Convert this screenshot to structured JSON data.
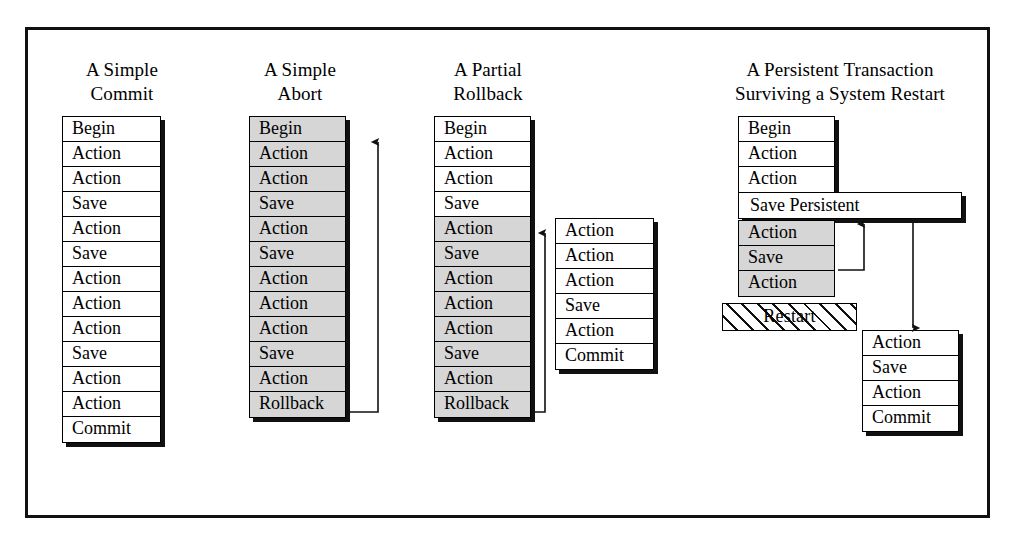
{
  "figure": {
    "title_hidden": "",
    "columns": [
      {
        "id": "simple-commit",
        "title_line1": "A Simple",
        "title_line2": "Commit",
        "rows": [
          {
            "label": "Begin",
            "shaded": false
          },
          {
            "label": "Action",
            "shaded": false
          },
          {
            "label": "Action",
            "shaded": false
          },
          {
            "label": "Save",
            "shaded": false
          },
          {
            "label": "Action",
            "shaded": false
          },
          {
            "label": "Save",
            "shaded": false
          },
          {
            "label": "Action",
            "shaded": false
          },
          {
            "label": "Action",
            "shaded": false
          },
          {
            "label": "Action",
            "shaded": false
          },
          {
            "label": "Save",
            "shaded": false
          },
          {
            "label": "Action",
            "shaded": false
          },
          {
            "label": "Action",
            "shaded": false
          },
          {
            "label": "Commit",
            "shaded": false
          }
        ]
      },
      {
        "id": "simple-abort",
        "title_line1": "A Simple",
        "title_line2": "Abort",
        "rows": [
          {
            "label": "Begin",
            "shaded": true
          },
          {
            "label": "Action",
            "shaded": true
          },
          {
            "label": "Action",
            "shaded": true
          },
          {
            "label": "Save",
            "shaded": true
          },
          {
            "label": "Action",
            "shaded": true
          },
          {
            "label": "Save",
            "shaded": true
          },
          {
            "label": "Action",
            "shaded": true
          },
          {
            "label": "Action",
            "shaded": true
          },
          {
            "label": "Action",
            "shaded": true
          },
          {
            "label": "Save",
            "shaded": true
          },
          {
            "label": "Action",
            "shaded": true
          },
          {
            "label": "Rollback",
            "shaded": true
          }
        ]
      },
      {
        "id": "partial-rollback",
        "title_line1": "A Partial",
        "title_line2": "Rollback",
        "rows": [
          {
            "label": "Begin",
            "shaded": false
          },
          {
            "label": "Action",
            "shaded": false
          },
          {
            "label": "Action",
            "shaded": false
          },
          {
            "label": "Save",
            "shaded": false
          },
          {
            "label": "Action",
            "shaded": true
          },
          {
            "label": "Save",
            "shaded": true
          },
          {
            "label": "Action",
            "shaded": true
          },
          {
            "label": "Action",
            "shaded": true
          },
          {
            "label": "Action",
            "shaded": true
          },
          {
            "label": "Save",
            "shaded": true
          },
          {
            "label": "Action",
            "shaded": true
          },
          {
            "label": "Rollback",
            "shaded": true
          }
        ],
        "side_rows": [
          {
            "label": "Action",
            "shaded": false
          },
          {
            "label": "Action",
            "shaded": false
          },
          {
            "label": "Action",
            "shaded": false
          },
          {
            "label": "Save",
            "shaded": false
          },
          {
            "label": "Action",
            "shaded": false
          },
          {
            "label": "Commit",
            "shaded": false
          }
        ]
      },
      {
        "id": "persistent-transaction",
        "title_line1": "A Persistent Transaction",
        "title_line2": "Surviving a System Restart",
        "rows_top": [
          {
            "label": "Begin",
            "shaded": false
          },
          {
            "label": "Action",
            "shaded": false
          },
          {
            "label": "Action",
            "shaded": false
          }
        ],
        "persistent_save_label": "Save  Persistent",
        "rows_bottom": [
          {
            "label": "Action",
            "shaded": true
          },
          {
            "label": "Save",
            "shaded": true
          },
          {
            "label": "Action",
            "shaded": true
          }
        ],
        "restart_label": "Restart",
        "resumed_rows": [
          {
            "label": "Action",
            "shaded": false
          },
          {
            "label": "Save",
            "shaded": false
          },
          {
            "label": "Action",
            "shaded": false
          },
          {
            "label": "Commit",
            "shaded": false
          }
        ]
      }
    ],
    "colors": {
      "ink": "#000000",
      "shade": "#d6d6d6",
      "paper": "#ffffff",
      "shadow": "#111111"
    }
  }
}
